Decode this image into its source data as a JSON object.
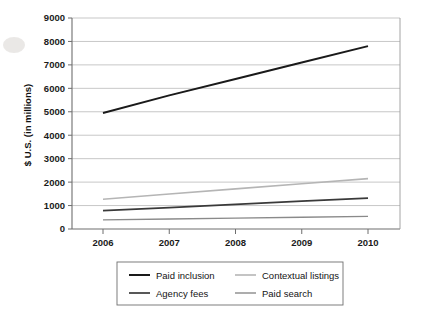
{
  "chart_data": {
    "type": "line",
    "title": "",
    "subtitle": "",
    "xlabel": "",
    "ylabel": "$ U.S. (in millions)",
    "categories": [
      "2006",
      "2007",
      "2008",
      "2009",
      "2010"
    ],
    "x": [
      2006,
      2007,
      2008,
      2009,
      2010
    ],
    "xlim": [
      2006,
      2010
    ],
    "ylim": [
      0,
      9000
    ],
    "yticks": [
      0,
      1000,
      2000,
      3000,
      4000,
      5000,
      6000,
      7000,
      8000,
      9000
    ],
    "ytick_labels": [
      "0",
      "1000",
      "2000",
      "3000",
      "4000",
      "5000",
      "6000",
      "7000",
      "8000",
      "9000"
    ],
    "xtick_labels": [
      "2006",
      "2007",
      "2008",
      "2009",
      "2010"
    ],
    "grid": "horizontal",
    "legend_position": "bottom",
    "series": [
      {
        "name": "Paid inclusion",
        "color": "#1a1a1a",
        "width": 2.0,
        "values": [
          4950,
          5700,
          6400,
          7100,
          7800
        ]
      },
      {
        "name": "Contextual listings",
        "color": "#b5b5b5",
        "width": 1.6,
        "values": [
          1270,
          1490,
          1710,
          1930,
          2150
        ]
      },
      {
        "name": "Agency fees",
        "color": "#3a3a3a",
        "width": 1.7,
        "values": [
          780,
          915,
          1050,
          1185,
          1320
        ]
      },
      {
        "name": "Paid search",
        "color": "#8a8a8a",
        "width": 1.4,
        "values": [
          390,
          428,
          465,
          503,
          540
        ]
      }
    ]
  },
  "legend": {
    "entries": [
      {
        "label": "Paid inclusion",
        "color": "#1a1a1a"
      },
      {
        "label": "Contextual listings",
        "color": "#b5b5b5"
      },
      {
        "label": "Agency fees",
        "color": "#3a3a3a"
      },
      {
        "label": "Paid search",
        "color": "#8a8a8a"
      }
    ]
  },
  "axes": {
    "y_title": "$ U.S. (in millions)"
  }
}
